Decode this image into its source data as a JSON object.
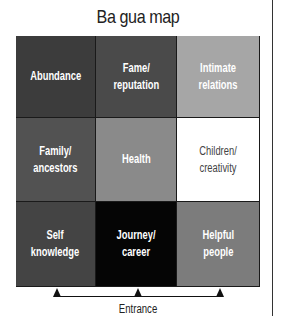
{
  "title": "Ba gua map",
  "cells": [
    {
      "label": "Abundance",
      "color": "#3c3c3c"
    },
    {
      "label": "Fame/\nreputation",
      "color": "#4a4a4a"
    },
    {
      "label": "Intimate\nrelations",
      "color": "#a6a6a6"
    },
    {
      "label": "Family/\nancestors",
      "color": "#525252"
    },
    {
      "label": "Health",
      "color": "#8a8a8a"
    },
    {
      "label": "Children/\ncreativity",
      "color": "#ffffff",
      "light": true
    },
    {
      "label": "Self\nknowledge",
      "color": "#444444"
    },
    {
      "label": "Journey/\ncareer",
      "color": "#050505"
    },
    {
      "label": "Helpful\npeople",
      "color": "#7c7c7c"
    }
  ],
  "entrance_label": "Entrance"
}
